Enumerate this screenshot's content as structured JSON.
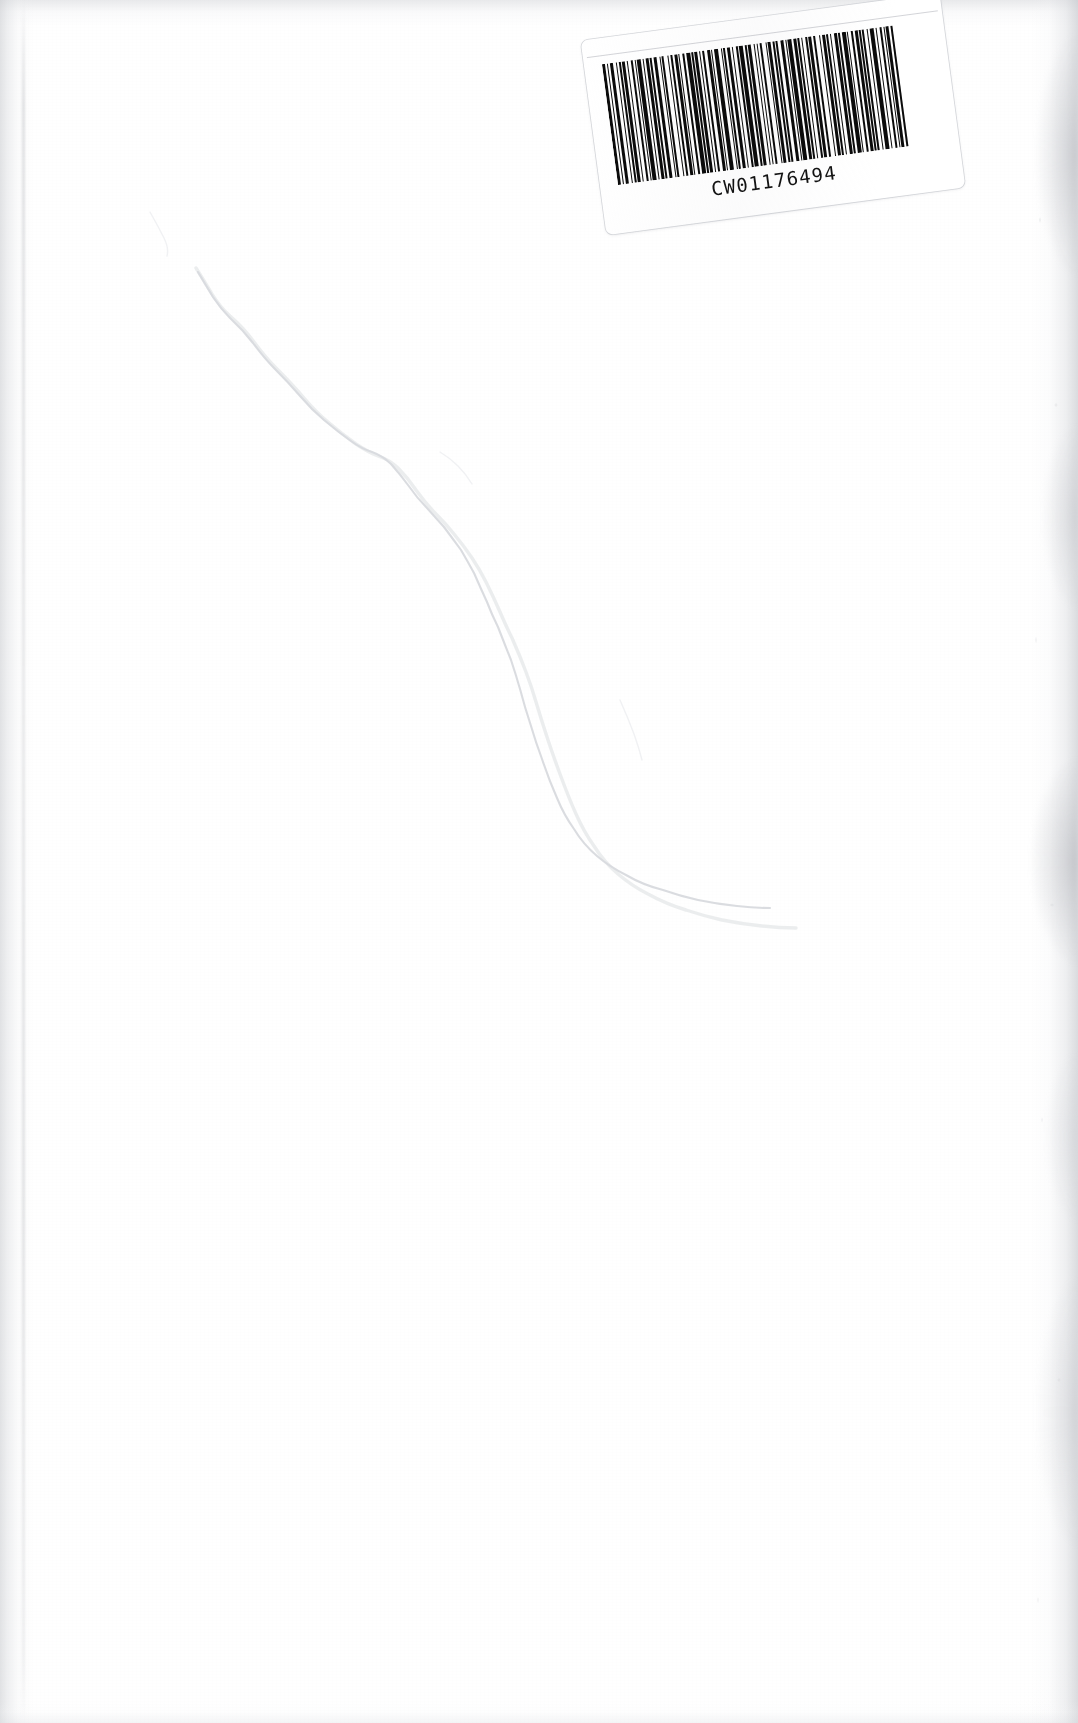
{
  "document": {
    "type": "scanned-book-page",
    "page_label": "",
    "body_text": "",
    "description": "Blank scanned page"
  },
  "barcode_label": {
    "code_text": "CW01176494",
    "symbology": "Code 128",
    "rotation_degrees": -7.6,
    "bar_color": "#0b0b0b",
    "label_background": "#ffffff",
    "bar_pattern": [
      3,
      2,
      1,
      2,
      3,
      3,
      1,
      2,
      2,
      1,
      3,
      2,
      1,
      3,
      2,
      2,
      1,
      1,
      4,
      2,
      1,
      2,
      3,
      1,
      2,
      2,
      3,
      3,
      1,
      1,
      2,
      4,
      1,
      2,
      2,
      2,
      3,
      1,
      1,
      3,
      2,
      2,
      4,
      1,
      2,
      1,
      3,
      2,
      1,
      2,
      2,
      3,
      3,
      1,
      1,
      2,
      4,
      3,
      1,
      1,
      2,
      2,
      3,
      2,
      1,
      3,
      2,
      1,
      4,
      2,
      2,
      1,
      3,
      3,
      1,
      2,
      1,
      2,
      2,
      4,
      1,
      1,
      3,
      2,
      2,
      1,
      2,
      3,
      3,
      2,
      1,
      1,
      4,
      2,
      3,
      1,
      2,
      2,
      1,
      3,
      2,
      1,
      3,
      2,
      2,
      4,
      1,
      2,
      3,
      1,
      2,
      2,
      1,
      3,
      3,
      1,
      2,
      2,
      4,
      1,
      1,
      3,
      2,
      2,
      3,
      1,
      2,
      1,
      2,
      3,
      1,
      2,
      4,
      2,
      1,
      3,
      2,
      2,
      1,
      1,
      3,
      2,
      2,
      3
    ]
  },
  "page_features": {
    "crease_label": "diagonal fold crease",
    "edge_shadow_left_label": "left scanner edge shadow",
    "edge_shadow_right_label": "right scanner edge shadow",
    "paper_color": "#ffffff",
    "crease_color": "#d8dade",
    "shadow_color": "#c8cace"
  }
}
